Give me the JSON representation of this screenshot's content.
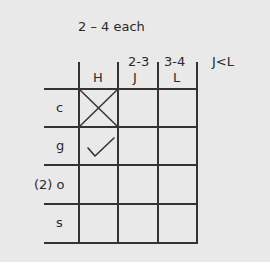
{
  "note": {
    "title": "2 – 4 each",
    "column_ranges": [
      "2-3",
      "3-4"
    ],
    "constraint": "J<L"
  },
  "grid": {
    "columns": [
      "H",
      "J",
      "L"
    ],
    "rows": [
      {
        "label": "c",
        "marks": [
          "X",
          "",
          ""
        ]
      },
      {
        "label": "g",
        "marks": [
          "check",
          "",
          ""
        ]
      },
      {
        "label": "(2) o",
        "marks": [
          "",
          "",
          ""
        ]
      },
      {
        "label": "s",
        "marks": [
          "",
          "",
          ""
        ]
      }
    ]
  }
}
